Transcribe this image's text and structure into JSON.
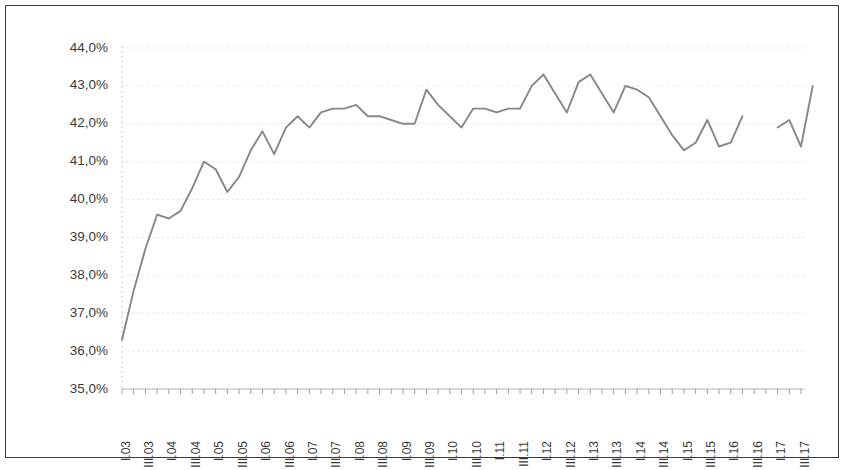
{
  "chart_data": {
    "type": "line",
    "title": "",
    "subtitle": "",
    "xlabel": "",
    "ylabel": "",
    "ylim": [
      35.0,
      44.0
    ],
    "y_tick_step": 1.0,
    "y_tick_labels": [
      "35,0%",
      "36,0%",
      "37,0%",
      "38,0%",
      "39,0%",
      "40,0%",
      "41,0%",
      "42,0%",
      "43,0%",
      "44,0%"
    ],
    "y_tick_values": [
      35.0,
      36.0,
      37.0,
      38.0,
      39.0,
      40.0,
      41.0,
      42.0,
      43.0,
      44.0
    ],
    "grid": true,
    "grid_axis": "y",
    "legend": false,
    "legend_position": "none",
    "value_unit": "%",
    "decimal_separator": ",",
    "line_color": "#878787",
    "grid_color": "#d8d8d8",
    "axis_color": "#b9b9b9",
    "border_color": "#3a3a3a",
    "background_color": "#ffffff",
    "x_tick_labels_shown": [
      "I.03",
      "III.03",
      "I.04",
      "III.04",
      "I.05",
      "III.05",
      "I.06",
      "III.06",
      "I.07",
      "III.07",
      "I.08",
      "III.08",
      "I.09",
      "III.09",
      "I.10",
      "III.10",
      "I.11",
      "III.11",
      "I.12",
      "III.12",
      "I.13",
      "III.13",
      "I.14",
      "III.14",
      "I.15",
      "III.15",
      "I.16",
      "III.16",
      "I.17",
      "III.17"
    ],
    "categories": [
      "I.03",
      "II.03",
      "III.03",
      "IV.03",
      "I.04",
      "II.04",
      "III.04",
      "IV.04",
      "I.05",
      "II.05",
      "III.05",
      "IV.05",
      "I.06",
      "II.06",
      "III.06",
      "IV.06",
      "I.07",
      "II.07",
      "III.07",
      "IV.07",
      "I.08",
      "II.08",
      "III.08",
      "IV.08",
      "I.09",
      "II.09",
      "III.09",
      "IV.09",
      "I.10",
      "II.10",
      "III.10",
      "IV.10",
      "I.11",
      "II.11",
      "III.11",
      "IV.11",
      "I.12",
      "II.12",
      "III.12",
      "IV.12",
      "I.13",
      "II.13",
      "III.13",
      "IV.13",
      "I.14",
      "II.14",
      "III.14",
      "IV.14",
      "I.15",
      "II.15",
      "III.15",
      "IV.15",
      "I.16",
      "II.16",
      "III.16",
      "IV.16",
      "I.17",
      "II.17",
      "III.17"
    ],
    "values": [
      36.3,
      37.6,
      38.7,
      39.6,
      39.5,
      39.7,
      40.3,
      41.0,
      40.8,
      40.2,
      40.6,
      41.3,
      41.8,
      41.2,
      41.9,
      42.2,
      41.9,
      42.3,
      42.4,
      42.4,
      42.5,
      42.2,
      42.2,
      42.1,
      42.0,
      42.0,
      42.9,
      42.5,
      42.2,
      41.9,
      42.4,
      42.4,
      42.3,
      42.4,
      42.4,
      43.0,
      43.3,
      42.8,
      42.3,
      43.1,
      43.3,
      42.8,
      42.3,
      43.0,
      42.9,
      42.7,
      42.2,
      41.7,
      41.3,
      41.5,
      42.1,
      41.4,
      41.5,
      42.2,
      null,
      null,
      41.9,
      42.1,
      41.4
    ],
    "notes": {
      "gap": "Data gap between III.15 and I.16 (IV.15 and I.16 missing)",
      "series_count": 1
    },
    "series": [
      {
        "name": "",
        "values": [
          36.3,
          37.6,
          38.7,
          39.6,
          39.5,
          39.7,
          40.3,
          41.0,
          40.8,
          40.2,
          40.6,
          41.3,
          41.8,
          41.2,
          41.9,
          42.2,
          41.9,
          42.3,
          42.4,
          42.4,
          42.5,
          42.2,
          42.2,
          42.1,
          42.0,
          42.0,
          42.9,
          42.5,
          42.2,
          41.9,
          42.4,
          42.4,
          42.3,
          42.4,
          42.4,
          43.0,
          43.3,
          42.8,
          42.3,
          43.1,
          43.3,
          42.8,
          42.3,
          43.0,
          42.9,
          42.7,
          42.2,
          41.7,
          41.3,
          41.5,
          42.1,
          41.4,
          41.5,
          42.2,
          null,
          null,
          41.9,
          42.1,
          41.4
        ]
      }
    ],
    "extra_tail": {
      "description": "final rise to 43,0% at end of series",
      "value": 43.0
    }
  }
}
